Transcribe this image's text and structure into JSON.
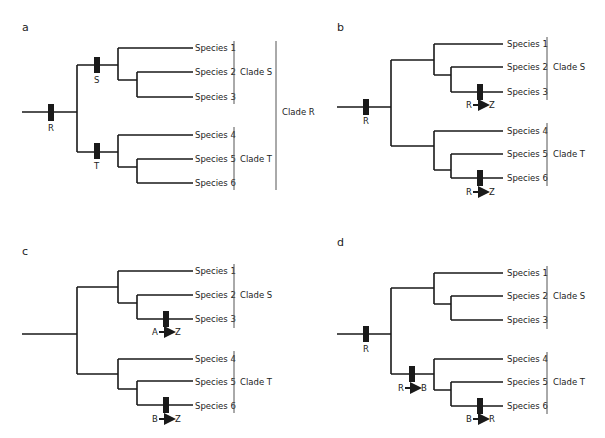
{
  "figure": {
    "panels": [
      {
        "label": "a",
        "species": [
          "Species 1",
          "Species 2",
          "Species 3",
          "Species 4",
          "Species 5",
          "Species 6"
        ],
        "clades": {
          "upper": "Clade S",
          "lower": "Clade T",
          "outer": "Clade R"
        },
        "markers": [
          {
            "position": "root",
            "label": "R"
          },
          {
            "position": "clade-S-stem",
            "label": "S"
          },
          {
            "position": "clade-T-stem",
            "label": "T"
          }
        ]
      },
      {
        "label": "b",
        "species": [
          "Species 1",
          "Species 2",
          "Species 3",
          "Species 4",
          "Species 5",
          "Species 6"
        ],
        "clades": {
          "upper": "Clade S",
          "lower": "Clade T"
        },
        "markers": [
          {
            "position": "root",
            "label": "R"
          },
          {
            "position": "species-3",
            "from": "R",
            "to": "Z"
          },
          {
            "position": "species-6",
            "from": "R",
            "to": "Z"
          }
        ]
      },
      {
        "label": "c",
        "species": [
          "Species 1",
          "Species 2",
          "Species 3",
          "Species 4",
          "Species 5",
          "Species 6"
        ],
        "clades": {
          "upper": "Clade S",
          "lower": "Clade T"
        },
        "markers": [
          {
            "position": "species-3",
            "from": "A",
            "to": "Z"
          },
          {
            "position": "species-6",
            "from": "B",
            "to": "Z"
          }
        ]
      },
      {
        "label": "d",
        "species": [
          "Species 1",
          "Species 2",
          "Species 3",
          "Species 4",
          "Species 5",
          "Species 6"
        ],
        "clades": {
          "upper": "Clade S",
          "lower": "Clade T"
        },
        "markers": [
          {
            "position": "root",
            "label": "R"
          },
          {
            "position": "clade-T-stem",
            "from": "R",
            "to": "B"
          },
          {
            "position": "species-6",
            "from": "B",
            "to": "R"
          }
        ]
      }
    ]
  }
}
